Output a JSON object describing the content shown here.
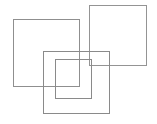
{
  "figure": {
    "canvas": {
      "width": 157,
      "height": 124,
      "background_color": "#ffffff"
    },
    "default_stroke_color": "#8c8c8c",
    "default_stroke_width": 1,
    "shapes": [
      {
        "name": "top-left-square",
        "type": "square",
        "x": 13,
        "y": 19,
        "width": 67,
        "height": 68,
        "stroke_color": "#8f8f8f",
        "stroke_width": 1,
        "fill": "none"
      },
      {
        "name": "top-right-square",
        "type": "square",
        "x": 89,
        "y": 5,
        "width": 58,
        "height": 61,
        "stroke_color": "#949494",
        "stroke_width": 1,
        "fill": "none"
      },
      {
        "name": "bottom-middle-square",
        "type": "square",
        "x": 43,
        "y": 51,
        "width": 67,
        "height": 63,
        "stroke_color": "#8a8a8a",
        "stroke_width": 1,
        "fill": "none"
      },
      {
        "name": "inner-square",
        "type": "square",
        "x": 55,
        "y": 59,
        "width": 37,
        "height": 40,
        "stroke_color": "#8a8a8a",
        "stroke_width": 1,
        "fill": "none"
      }
    ]
  }
}
